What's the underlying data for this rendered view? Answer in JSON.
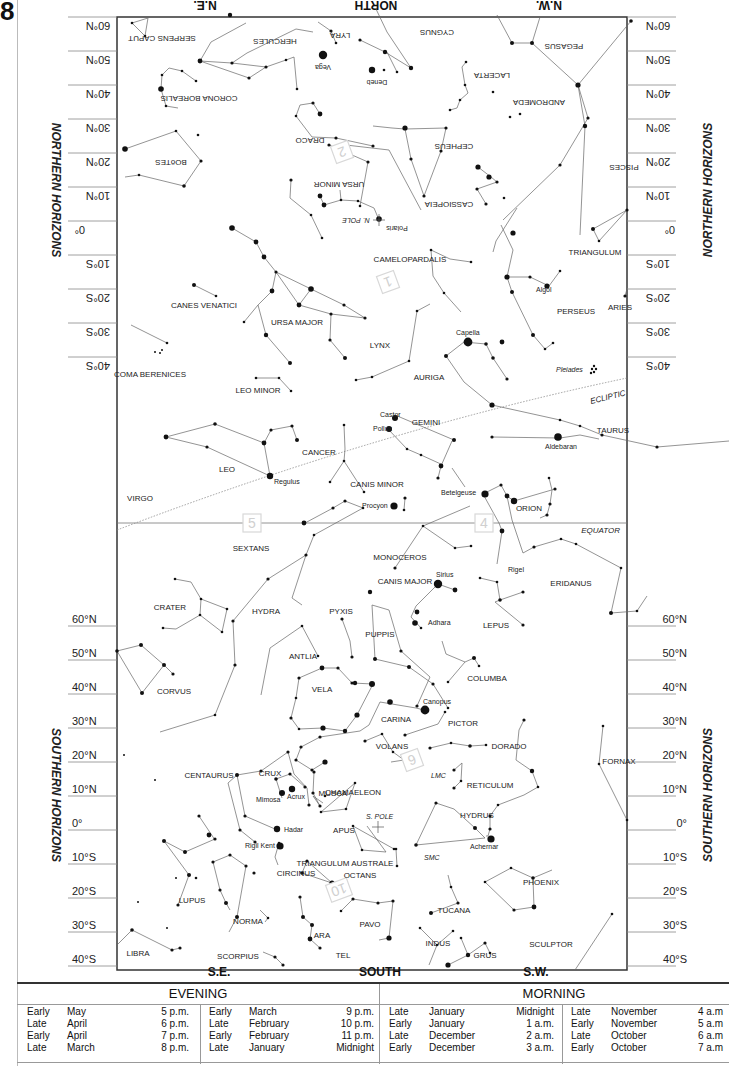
{
  "chart_number": "8",
  "directions": {
    "north": {
      "left": "N.E.",
      "center": "NORTH",
      "right": "N.W."
    },
    "south": {
      "left": "S.E.",
      "center": "SOUTH",
      "right": "S.W."
    }
  },
  "side_labels": {
    "northern": "NORTHERN HORIZONS",
    "southern": "SOUTHERN HORIZONS"
  },
  "latitude_ticks": [
    "60°N",
    "50°N",
    "40°N",
    "30°N",
    "20°N",
    "10°N",
    "0°",
    "10°S",
    "20°S",
    "30°S",
    "40°S"
  ],
  "reference_lines": {
    "equator": "EQUATOR",
    "ecliptic": "ECLIPTIC",
    "north_pole": "N. POLE",
    "south_pole": "S. POLE"
  },
  "region_markers": [
    "1",
    "2",
    "4",
    "5",
    "6",
    "10"
  ],
  "constellations_northern_inverted": [
    "SERPENS CAPUT",
    "HERCULES",
    "LYRA",
    "CYGNUS",
    "PEGASUS",
    "CORONA BOREALIS",
    "LACERTA",
    "ANDROMEDA",
    "DRACO",
    "CEPHEUS",
    "BOöTES",
    "URSA MINOR",
    "PISCES",
    "CASSIOPEIA"
  ],
  "constellations": [
    "CAMELOPARDALIS",
    "TRIANGULUM",
    "CANES VENATICI",
    "URSA MAJOR",
    "PERSEUS",
    "ARIES",
    "LYNX",
    "COMA BERENICES",
    "AURIGA",
    "LEO MINOR",
    "GEMINI",
    "TAURUS",
    "LEO",
    "CANCER",
    "CANIS MINOR",
    "VIRGO",
    "ORION",
    "SEXTANS",
    "MONOCEROS",
    "CANIS MAJOR",
    "ERIDANUS",
    "CRATER",
    "HYDRA",
    "PYXIS",
    "LEPUS",
    "PUPPIS",
    "ANTLIA",
    "COLUMBA",
    "CORVUS",
    "VELA",
    "CARINA",
    "PICTOR",
    "VOLANS",
    "DORADO",
    "FORNAX",
    "CENTAURUS",
    "CRUX",
    "RETICULUM",
    "MUSCA",
    "CHAMAELEON",
    "HYDRUS",
    "APUS",
    "TRIANGULUM AUSTRALE",
    "OCTANS",
    "CIRCINUS",
    "PHOENIX",
    "LUPUS",
    "TUCANA",
    "NORMA",
    "PAVO",
    "ARA",
    "INDUS",
    "SCULPTOR",
    "LIBRA",
    "SCORPIUS",
    "TEL",
    "GRUS"
  ],
  "named_stars": [
    "Vega",
    "Deneb",
    "Polaris",
    "Algol",
    "Capella",
    "Castor",
    "Pollux",
    "Aldebaran",
    "Regulus",
    "Procyon",
    "Betelgeuse",
    "Rigel",
    "Sirius",
    "Adhara",
    "Canopus",
    "Mimosa",
    "Acrux",
    "Hadar",
    "Rigil Kent",
    "Achernar"
  ],
  "deep_sky": [
    "Pleiades",
    "LMC",
    "SMC"
  ],
  "viewing_times": {
    "evening": {
      "title": "EVENING",
      "columns": [
        [
          {
            "period": "Early",
            "month": "May",
            "time": "5 p.m."
          },
          {
            "period": "Late",
            "month": "April",
            "time": "6 p.m."
          },
          {
            "period": "Early",
            "month": "April",
            "time": "7 p.m."
          },
          {
            "period": "Late",
            "month": "March",
            "time": "8 p.m."
          }
        ],
        [
          {
            "period": "Early",
            "month": "March",
            "time": "9 p.m."
          },
          {
            "period": "Late",
            "month": "February",
            "time": "10 p.m."
          },
          {
            "period": "Early",
            "month": "February",
            "time": "11 p.m."
          },
          {
            "period": "Late",
            "month": "January",
            "time": "Midnight"
          }
        ]
      ]
    },
    "morning": {
      "title": "MORNING",
      "columns": [
        [
          {
            "period": "Late",
            "month": "January",
            "time": "Midnight"
          },
          {
            "period": "Early",
            "month": "January",
            "time": "1 a.m."
          },
          {
            "period": "Late",
            "month": "December",
            "time": "2 a.m."
          },
          {
            "period": "Early",
            "month": "December",
            "time": "3 a.m."
          }
        ],
        [
          {
            "period": "Late",
            "month": "November",
            "time": "4 a.m"
          },
          {
            "period": "Early",
            "month": "November",
            "time": "5 a.m"
          },
          {
            "period": "Late",
            "month": "October",
            "time": "6 a.m"
          },
          {
            "period": "Early",
            "month": "October",
            "time": "7 a.m"
          }
        ]
      ]
    }
  }
}
